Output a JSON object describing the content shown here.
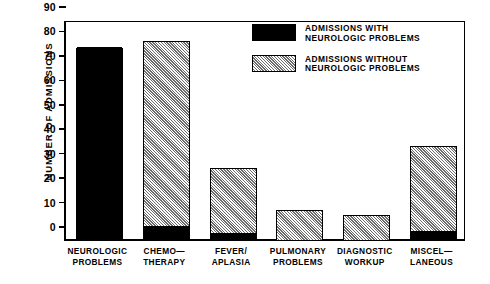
{
  "chart_data": {
    "type": "bar",
    "stacked": true,
    "title": "",
    "xlabel": "",
    "ylabel": "NUMBER OF ADMISSIONS",
    "ylim": [
      0,
      90
    ],
    "yticks": [
      0,
      10,
      20,
      30,
      40,
      50,
      60,
      70,
      80,
      90
    ],
    "grid": false,
    "legend_position": "top-right",
    "categories": [
      "NEUROLOGIC\nPROBLEMS",
      "CHEMO—\nTHERAPY",
      "FEVER/\nAPLASIA",
      "PULMONARY\nPROBLEMS",
      "DIAGNOSTIC\nWORKUP",
      "MISCEL—\nLANEOUS"
    ],
    "series": [
      {
        "name": "ADMISSIONS WITH\nNEUROLOGIC PROBLEMS",
        "fill": "solid-black",
        "color": "#000000",
        "values": [
          78,
          5,
          2,
          0,
          0,
          3
        ]
      },
      {
        "name": "ADMISSIONS WITHOUT\nNEUROLOGIC PROBLEMS",
        "fill": "diagonal-hatch",
        "color": "#d2d2d2",
        "values": [
          0,
          76,
          27,
          12,
          10,
          35
        ]
      }
    ],
    "totals": [
      78,
      81,
      29,
      12,
      10,
      38
    ]
  },
  "legend": {
    "items": [
      {
        "label": "ADMISSIONS WITH\nNEUROLOGIC PROBLEMS",
        "swatch": "solid"
      },
      {
        "label": "ADMISSIONS WITHOUT\nNEUROLOGIC PROBLEMS",
        "swatch": "hatch"
      }
    ]
  },
  "axis": {
    "y_title": "NUMBER OF ADMISSIONS",
    "y_tick_labels": [
      "90",
      "80",
      "70",
      "60",
      "50",
      "40",
      "30",
      "20",
      "10",
      "0"
    ]
  }
}
